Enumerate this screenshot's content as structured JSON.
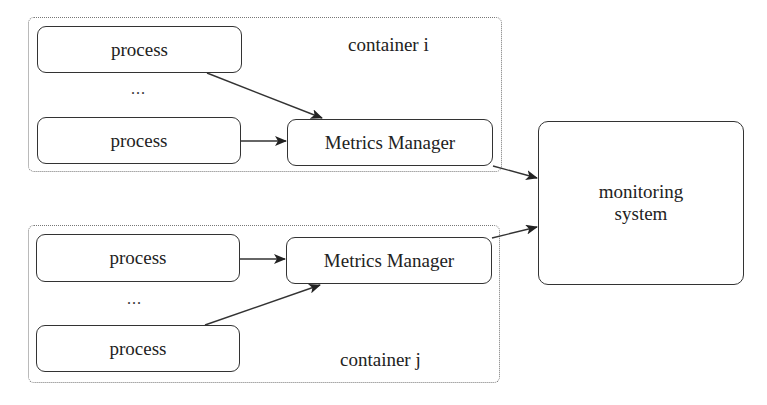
{
  "diagram": {
    "containers": [
      {
        "id": "container-i",
        "label": "container i",
        "processes": [
          {
            "label": "process"
          },
          {
            "label": "process"
          }
        ],
        "ellipsis": "...",
        "metrics_manager": {
          "label": "Metrics Manager"
        }
      },
      {
        "id": "container-j",
        "label": "container j",
        "processes": [
          {
            "label": "process"
          },
          {
            "label": "process"
          }
        ],
        "ellipsis": "...",
        "metrics_manager": {
          "label": "Metrics Manager"
        }
      }
    ],
    "monitoring_system": {
      "label_line1": "monitoring",
      "label_line2": "system"
    },
    "edges": [
      {
        "from": "container i / process 1",
        "to": "container i / Metrics Manager"
      },
      {
        "from": "container i / process 2",
        "to": "container i / Metrics Manager"
      },
      {
        "from": "container i / Metrics Manager",
        "to": "monitoring system"
      },
      {
        "from": "container j / process 1",
        "to": "container j / Metrics Manager"
      },
      {
        "from": "container j / process 2",
        "to": "container j / Metrics Manager"
      },
      {
        "from": "container j / Metrics Manager",
        "to": "monitoring system"
      }
    ]
  }
}
